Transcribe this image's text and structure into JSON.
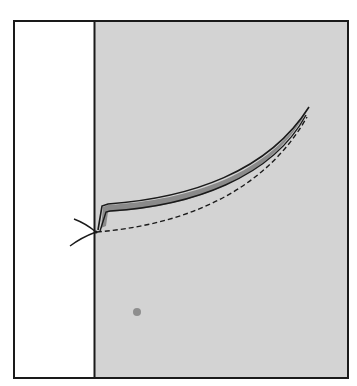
{
  "diagram": {
    "type": "sewing-illustration",
    "colors": {
      "background": "#ffffff",
      "fabric": "#d3d3d3",
      "outline": "#1a1a1a",
      "seam_fill": "#8a8a8a",
      "spot": "#8e8e8e"
    },
    "frame": {
      "x": 14,
      "y": 21,
      "width": 334,
      "height": 357
    },
    "divider_x": 94,
    "seam_curve": {
      "start": [
        101,
        230
      ],
      "end": [
        309,
        108
      ]
    },
    "dashed_line": {
      "start": [
        96,
        232
      ],
      "end": [
        307,
        117
      ]
    },
    "thread_knot": {
      "x": 95,
      "y": 232
    },
    "spot": {
      "x": 137,
      "y": 312,
      "r": 4
    }
  }
}
